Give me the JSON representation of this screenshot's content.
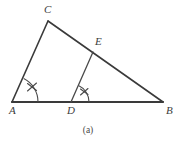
{
  "figure": {
    "caption": "(a)",
    "stroke_color": "#3a3a3a",
    "label_color": "#3c3c3c",
    "background_color": "#ffffff",
    "vertices": [
      {
        "id": "A",
        "label": "A",
        "x": 12,
        "y": 102,
        "label_x": 9,
        "label_y": 114
      },
      {
        "id": "B",
        "label": "B",
        "x": 163,
        "y": 102,
        "label_x": 166,
        "label_y": 114
      },
      {
        "id": "C",
        "label": "C",
        "x": 48,
        "y": 21,
        "label_x": 44,
        "label_y": 13
      },
      {
        "id": "D",
        "label": "D",
        "x": 71,
        "y": 102,
        "label_x": 67,
        "label_y": 114
      },
      {
        "id": "E",
        "label": "E",
        "x": 93,
        "y": 52,
        "label_x": 95,
        "label_y": 45
      }
    ],
    "segments": [
      {
        "name": "segment-AB",
        "from": "A",
        "to": "B",
        "weight": "heavy"
      },
      {
        "name": "segment-AC",
        "from": "A",
        "to": "C",
        "weight": "normal"
      },
      {
        "name": "segment-CB",
        "from": "C",
        "to": "B",
        "weight": "normal"
      },
      {
        "name": "segment-DE",
        "from": "D",
        "to": "E",
        "weight": "thin"
      }
    ],
    "angle_marks": [
      {
        "name": "angle-mark-A",
        "at": "A",
        "radius": 26,
        "ticks": 1
      },
      {
        "name": "angle-mark-D",
        "at": "D",
        "radius": 18,
        "ticks": 1
      }
    ]
  }
}
